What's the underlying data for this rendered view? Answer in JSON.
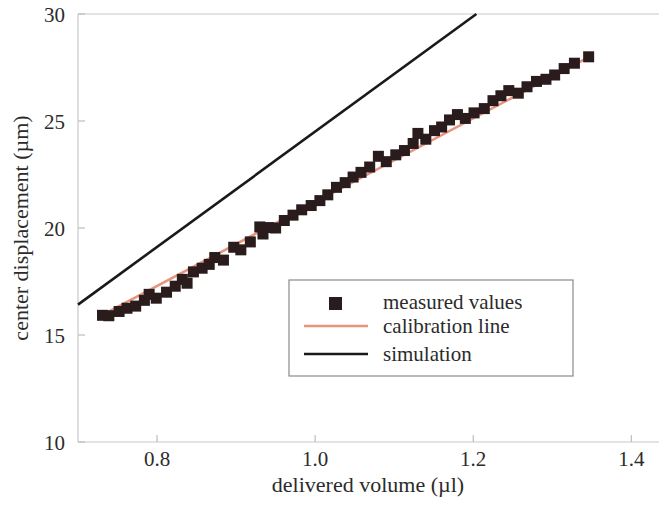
{
  "chart_data": {
    "type": "scatter",
    "title": "",
    "xlabel": "delivered volume (µl)",
    "ylabel": "center displacement (µm)",
    "xlim": [
      0.7,
      1.435
    ],
    "ylim": [
      10,
      30
    ],
    "xticks": [
      0.8,
      1.0,
      1.2,
      1.4
    ],
    "xtick_labels": [
      "0.8",
      "1.0",
      "1.2",
      "1.4"
    ],
    "yticks": [
      10,
      15,
      20,
      25,
      30
    ],
    "ytick_labels": [
      "10",
      "15",
      "20",
      "25",
      "30"
    ],
    "grid": false,
    "legend_position": "center-right-inside",
    "series": [
      {
        "name": "measured values",
        "type": "scatter",
        "marker": "square",
        "color": "#2a1c1c",
        "points": [
          [
            0.731,
            15.92
          ],
          [
            0.739,
            15.9
          ],
          [
            0.752,
            16.1
          ],
          [
            0.762,
            16.25
          ],
          [
            0.773,
            16.35
          ],
          [
            0.784,
            16.62
          ],
          [
            0.79,
            16.9
          ],
          [
            0.799,
            16.72
          ],
          [
            0.812,
            17.0
          ],
          [
            0.823,
            17.28
          ],
          [
            0.832,
            17.6
          ],
          [
            0.838,
            17.42
          ],
          [
            0.846,
            17.95
          ],
          [
            0.857,
            18.12
          ],
          [
            0.866,
            18.3
          ],
          [
            0.873,
            18.62
          ],
          [
            0.884,
            18.5
          ],
          [
            0.897,
            19.1
          ],
          [
            0.906,
            18.98
          ],
          [
            0.918,
            19.35
          ],
          [
            0.93,
            20.05
          ],
          [
            0.934,
            19.72
          ],
          [
            0.941,
            20.02
          ],
          [
            0.95,
            20.0
          ],
          [
            0.961,
            20.35
          ],
          [
            0.972,
            20.6
          ],
          [
            0.983,
            20.85
          ],
          [
            0.995,
            21.05
          ],
          [
            1.006,
            21.28
          ],
          [
            1.016,
            21.55
          ],
          [
            1.027,
            21.9
          ],
          [
            1.038,
            22.12
          ],
          [
            1.048,
            22.38
          ],
          [
            1.058,
            22.6
          ],
          [
            1.069,
            22.85
          ],
          [
            1.08,
            23.35
          ],
          [
            1.09,
            23.1
          ],
          [
            1.102,
            23.42
          ],
          [
            1.113,
            23.62
          ],
          [
            1.124,
            23.95
          ],
          [
            1.13,
            24.42
          ],
          [
            1.14,
            24.15
          ],
          [
            1.151,
            24.55
          ],
          [
            1.16,
            24.72
          ],
          [
            1.17,
            25.05
          ],
          [
            1.18,
            25.3
          ],
          [
            1.19,
            25.12
          ],
          [
            1.201,
            25.38
          ],
          [
            1.214,
            25.58
          ],
          [
            1.225,
            25.95
          ],
          [
            1.235,
            26.18
          ],
          [
            1.245,
            26.42
          ],
          [
            1.257,
            26.3
          ],
          [
            1.268,
            26.6
          ],
          [
            1.28,
            26.85
          ],
          [
            1.292,
            26.95
          ],
          [
            1.303,
            27.15
          ],
          [
            1.315,
            27.45
          ],
          [
            1.328,
            27.7
          ],
          [
            1.346,
            28.0
          ]
        ]
      },
      {
        "name": "calibration line",
        "type": "line",
        "color": "#e8957d",
        "endpoints": [
          [
            0.725,
            15.82
          ],
          [
            1.352,
            28.1
          ]
        ],
        "slope": 19.6,
        "intercept": 1.61
      },
      {
        "name": "simulation",
        "type": "line",
        "color": "#1a1a1a",
        "endpoints": [
          [
            0.7,
            16.42
          ],
          [
            1.204,
            30.0
          ]
        ],
        "slope": 26.95,
        "intercept": -2.44
      }
    ],
    "legend_entries": [
      {
        "label": "measured values",
        "marker": "square",
        "color": "#2a1c1c"
      },
      {
        "label": "calibration line",
        "marker": "line",
        "color": "#e8957d"
      },
      {
        "label": "simulation",
        "marker": "line",
        "color": "#1a1a1a"
      }
    ]
  }
}
